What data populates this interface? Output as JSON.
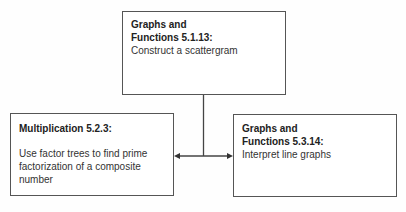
{
  "diagram": {
    "nodes": [
      {
        "id": "top",
        "title": "Graphs and Functions 5.1.13:",
        "title_line1": "Graphs and",
        "title_line2": "Functions 5.1.13:",
        "description": "Construct a scattergram"
      },
      {
        "id": "left",
        "title": "Multiplication 5.2.3:",
        "description": "Use factor trees to find prime factorization of a composite number"
      },
      {
        "id": "right",
        "title": "Graphs and Functions 5.3.14:",
        "title_line1": "Graphs and",
        "title_line2": "Functions 5.3.14:",
        "description": "Interpret line graphs"
      }
    ],
    "edges": [
      {
        "from": "top",
        "to": "left",
        "style": "arrow"
      },
      {
        "from": "top",
        "to": "right",
        "style": "arrow"
      }
    ]
  }
}
